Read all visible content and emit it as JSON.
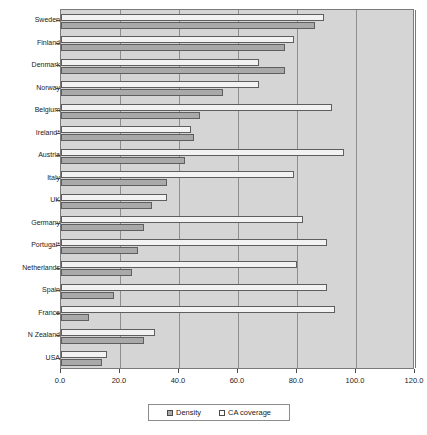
{
  "chart_data": {
    "type": "bar",
    "orientation": "horizontal",
    "title": "",
    "subtitle": "",
    "xlabel": "",
    "ylabel": "",
    "xlim": [
      0,
      120
    ],
    "xticks": [
      0,
      20,
      40,
      60,
      80,
      100,
      120
    ],
    "xtick_labels": [
      "0.0",
      "20.0",
      "40.0",
      "60.0",
      "80.0",
      "100.0",
      "120.0"
    ],
    "grid": true,
    "grid_axis": "x",
    "legend_position": "bottom-center",
    "categories": [
      "Sweden",
      "Finland",
      "Denmark",
      "Norway",
      "Belgium",
      "Ireland*",
      "Austria",
      "Italy",
      "UK",
      "Germany",
      "Portugal*",
      "Netherlands",
      "Spain",
      "France",
      "N Zealand",
      "USA"
    ],
    "series": [
      {
        "name": "CA coverage",
        "color": "#f2f2f2",
        "values": [
          89,
          79,
          67,
          67,
          92,
          44,
          96,
          79,
          36,
          82,
          90,
          80,
          90,
          93,
          32,
          15.5
        ]
      },
      {
        "name": "Density",
        "color": "#a9a9a9",
        "values": [
          86,
          76,
          76,
          55,
          47,
          45,
          42,
          36,
          31,
          28,
          26,
          24,
          18,
          9.5,
          28,
          14
        ]
      }
    ]
  },
  "legend": {
    "items": [
      {
        "label": "Density",
        "swatch": "density"
      },
      {
        "label": "CA coverage",
        "swatch": "coverage"
      }
    ]
  },
  "colors": {
    "plot_background": "#d5d5d5",
    "density_bar": "#a9a9a9",
    "coverage_bar": "#f2f2f2",
    "gridline": "#8e8e8e",
    "frame": "#7a7a7a",
    "text": "#1b1b1b",
    "page_background": "#ffffff"
  }
}
